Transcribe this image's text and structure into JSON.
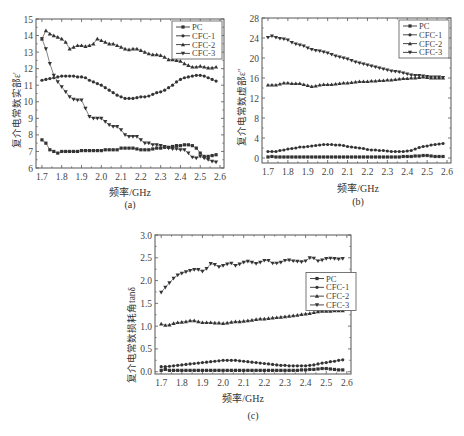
{
  "figure": {
    "captions": [
      "(a)",
      "(b)",
      "(c)"
    ],
    "xlabel": "频率/GHz"
  },
  "colors": {
    "axis": "#555555",
    "series": "#333333",
    "series_line": "#777777"
  },
  "chart_data": [
    {
      "id": "a",
      "type": "line",
      "caption": "(a)",
      "title": "",
      "xlabel": "频率/GHz",
      "ylabel": "复介电常数实部ε'",
      "xlim": [
        1.67,
        2.62
      ],
      "ylim": [
        6,
        15
      ],
      "xticks": [
        "1.7",
        "1.8",
        "1.9",
        "2.0",
        "2.1",
        "2.2",
        "2.3",
        "2.4",
        "2.5",
        "2.6"
      ],
      "yticks": [
        "6",
        "7",
        "8",
        "9",
        "10",
        "11",
        "12",
        "13",
        "14",
        "15"
      ],
      "legend": {
        "entries": [
          "PC",
          "CFC-1",
          "CFC-2",
          "CFC-3"
        ],
        "position": "upper right"
      },
      "grid": false,
      "x": [
        1.7,
        1.72,
        1.74,
        1.76,
        1.78,
        1.8,
        1.82,
        1.84,
        1.86,
        1.88,
        1.9,
        1.92,
        1.94,
        1.96,
        1.98,
        2.0,
        2.02,
        2.04,
        2.06,
        2.08,
        2.1,
        2.12,
        2.14,
        2.16,
        2.18,
        2.2,
        2.22,
        2.24,
        2.26,
        2.28,
        2.3,
        2.32,
        2.34,
        2.36,
        2.38,
        2.4,
        2.42,
        2.44,
        2.46,
        2.48,
        2.5,
        2.52,
        2.54,
        2.56,
        2.58
      ],
      "series": [
        {
          "name": "PC",
          "marker": "square",
          "values": [
            7.7,
            7.5,
            7.1,
            7.0,
            6.9,
            7.0,
            7.0,
            7.0,
            7.0,
            7.0,
            7.05,
            7.05,
            7.05,
            7.05,
            7.05,
            7.05,
            7.1,
            7.1,
            7.1,
            7.1,
            7.2,
            7.2,
            7.2,
            7.2,
            7.15,
            7.1,
            7.1,
            7.1,
            7.15,
            7.2,
            7.2,
            7.25,
            7.25,
            7.3,
            7.35,
            7.35,
            7.4,
            7.4,
            7.35,
            7.2,
            6.9,
            6.7,
            6.7,
            6.75,
            6.8
          ]
        },
        {
          "name": "CFC-1",
          "marker": "circle",
          "values": [
            11.3,
            11.35,
            11.4,
            11.45,
            11.5,
            11.55,
            11.55,
            11.55,
            11.55,
            11.5,
            11.5,
            11.45,
            11.3,
            11.2,
            11.1,
            11.0,
            10.85,
            10.7,
            10.55,
            10.4,
            10.3,
            10.2,
            10.2,
            10.2,
            10.25,
            10.3,
            10.3,
            10.35,
            10.45,
            10.55,
            10.6,
            10.7,
            10.85,
            11.0,
            11.2,
            11.35,
            11.45,
            11.5,
            11.55,
            11.6,
            11.6,
            11.55,
            11.45,
            11.35,
            11.25
          ]
        },
        {
          "name": "CFC-2",
          "marker": "triangle-up",
          "values": [
            13.8,
            14.3,
            14.1,
            14.0,
            13.9,
            13.8,
            13.6,
            13.2,
            13.3,
            13.4,
            13.4,
            13.35,
            13.4,
            13.5,
            13.8,
            13.7,
            13.6,
            13.5,
            13.5,
            13.4,
            13.3,
            13.2,
            13.15,
            13.2,
            13.2,
            13.1,
            13.0,
            12.9,
            12.85,
            12.85,
            12.8,
            12.7,
            12.55,
            12.55,
            12.5,
            12.45,
            12.3,
            12.2,
            12.1,
            12.1,
            12.15,
            12.1,
            12.05,
            12.05,
            12.1
          ]
        },
        {
          "name": "CFC-3",
          "marker": "triangle-down",
          "values": [
            13.8,
            13.2,
            12.3,
            11.6,
            11.2,
            10.9,
            10.6,
            10.3,
            10.15,
            10.1,
            10.1,
            9.6,
            9.1,
            9.0,
            9.0,
            9.0,
            8.8,
            8.6,
            8.5,
            8.5,
            8.3,
            8.0,
            7.9,
            7.9,
            7.9,
            7.7,
            7.5,
            7.5,
            7.4,
            7.4,
            7.35,
            7.3,
            7.2,
            7.15,
            7.15,
            7.1,
            7.1,
            6.9,
            6.65,
            6.6,
            6.7,
            6.6,
            6.5,
            6.4,
            6.35
          ]
        }
      ]
    },
    {
      "id": "b",
      "type": "line",
      "caption": "(b)",
      "title": "",
      "xlabel": "频率/GHz",
      "ylabel": "复介电常数虚部ε''",
      "xlim": [
        1.67,
        2.62
      ],
      "ylim": [
        -1,
        28
      ],
      "xticks": [
        "1.7",
        "1.8",
        "1.9",
        "2.0",
        "2.1",
        "2.2",
        "2.3",
        "2.4",
        "2.5",
        "2.6"
      ],
      "yticks": [
        "0",
        "4",
        "8",
        "12",
        "16",
        "20",
        "24",
        "28"
      ],
      "legend": {
        "entries": [
          "PC",
          "CFC-1",
          "CFC-2",
          "CFC-3"
        ],
        "position": "upper right"
      },
      "grid": false,
      "x": [
        1.7,
        1.72,
        1.74,
        1.76,
        1.78,
        1.8,
        1.82,
        1.84,
        1.86,
        1.88,
        1.9,
        1.92,
        1.94,
        1.96,
        1.98,
        2.0,
        2.02,
        2.04,
        2.06,
        2.08,
        2.1,
        2.12,
        2.14,
        2.16,
        2.18,
        2.2,
        2.22,
        2.24,
        2.26,
        2.28,
        2.3,
        2.32,
        2.34,
        2.36,
        2.38,
        2.4,
        2.42,
        2.44,
        2.46,
        2.48,
        2.5,
        2.52,
        2.54,
        2.56,
        2.58
      ],
      "series": [
        {
          "name": "PC",
          "marker": "square",
          "values": [
            0.2,
            0.3,
            0.2,
            0.2,
            0.2,
            0.2,
            0.2,
            0.2,
            0.2,
            0.2,
            0.2,
            0.2,
            0.2,
            0.2,
            0.2,
            0.2,
            0.2,
            0.2,
            0.2,
            0.2,
            0.2,
            0.2,
            0.2,
            0.2,
            0.2,
            0.2,
            0.2,
            0.2,
            0.2,
            0.2,
            0.2,
            0.2,
            0.2,
            0.2,
            0.3,
            0.3,
            0.3,
            0.4,
            0.4,
            0.5,
            0.5,
            0.4,
            0.3,
            0.3,
            0.3
          ]
        },
        {
          "name": "CFC-1",
          "marker": "circle",
          "values": [
            1.3,
            1.3,
            1.3,
            1.5,
            1.6,
            1.8,
            1.9,
            2.0,
            2.2,
            2.2,
            2.3,
            2.4,
            2.5,
            2.6,
            2.7,
            2.7,
            2.7,
            2.6,
            2.6,
            2.5,
            2.3,
            2.2,
            2.1,
            2.0,
            1.9,
            1.7,
            1.6,
            1.6,
            1.5,
            1.5,
            1.4,
            1.3,
            1.3,
            1.3,
            1.3,
            1.4,
            1.5,
            1.8,
            2.1,
            2.3,
            2.4,
            2.6,
            2.7,
            2.8,
            2.9
          ]
        },
        {
          "name": "CFC-2",
          "marker": "triangle-up",
          "values": [
            14.6,
            14.6,
            14.6,
            14.8,
            15.0,
            15.0,
            14.9,
            14.9,
            14.9,
            14.7,
            14.5,
            14.3,
            14.4,
            14.6,
            14.7,
            14.7,
            14.7,
            14.8,
            14.9,
            15.0,
            15.0,
            15.1,
            15.2,
            15.3,
            15.3,
            15.3,
            15.4,
            15.4,
            15.5,
            15.5,
            15.6,
            15.6,
            15.7,
            15.8,
            15.9,
            15.9,
            16.0,
            16.0,
            16.1,
            16.2,
            16.1,
            16.0,
            16.0,
            16.0,
            16.0
          ]
        },
        {
          "name": "CFC-3",
          "marker": "triangle-down",
          "values": [
            24.1,
            24.4,
            24.1,
            23.9,
            23.8,
            23.6,
            23.1,
            22.8,
            22.6,
            22.4,
            22.0,
            21.7,
            21.5,
            21.4,
            21.2,
            21.0,
            20.7,
            20.4,
            20.2,
            20.0,
            19.8,
            19.5,
            19.2,
            19.0,
            18.8,
            18.6,
            18.4,
            18.2,
            18.0,
            17.8,
            17.6,
            17.4,
            17.3,
            17.2,
            17.0,
            16.8,
            16.6,
            16.5,
            16.5,
            16.4,
            16.3,
            16.2,
            16.2,
            16.2,
            16.1
          ]
        }
      ]
    },
    {
      "id": "c",
      "type": "line",
      "caption": "(c)",
      "title": "",
      "xlabel": "频率/GHz",
      "ylabel": "复介电常数损耗角tanδ",
      "xlim": [
        1.67,
        2.62
      ],
      "ylim": [
        -0.05,
        3.0
      ],
      "xticks": [
        "1.7",
        "1.8",
        "1.9",
        "2.0",
        "2.1",
        "2.2",
        "2.3",
        "2.4",
        "2.5",
        "2.6"
      ],
      "yticks": [
        "0.0",
        "0.5",
        "1.0",
        "1.5",
        "2.0",
        "2.5",
        "3.0"
      ],
      "legend": {
        "entries": [
          "PC",
          "CFC-1",
          "CFC-2",
          "CFC-3"
        ],
        "position": "center right"
      },
      "grid": false,
      "x": [
        1.7,
        1.72,
        1.74,
        1.76,
        1.78,
        1.8,
        1.82,
        1.84,
        1.86,
        1.88,
        1.9,
        1.92,
        1.94,
        1.96,
        1.98,
        2.0,
        2.02,
        2.04,
        2.06,
        2.08,
        2.1,
        2.12,
        2.14,
        2.16,
        2.18,
        2.2,
        2.22,
        2.24,
        2.26,
        2.28,
        2.3,
        2.32,
        2.34,
        2.36,
        2.38,
        2.4,
        2.42,
        2.44,
        2.46,
        2.48,
        2.5,
        2.52,
        2.54,
        2.56,
        2.58
      ],
      "series": [
        {
          "name": "PC",
          "marker": "square",
          "values": [
            0.03,
            0.05,
            0.03,
            0.03,
            0.03,
            0.03,
            0.03,
            0.03,
            0.03,
            0.03,
            0.03,
            0.03,
            0.03,
            0.03,
            0.03,
            0.03,
            0.03,
            0.03,
            0.03,
            0.03,
            0.03,
            0.03,
            0.03,
            0.03,
            0.03,
            0.03,
            0.03,
            0.03,
            0.03,
            0.03,
            0.03,
            0.03,
            0.03,
            0.03,
            0.04,
            0.04,
            0.05,
            0.05,
            0.06,
            0.07,
            0.07,
            0.06,
            0.05,
            0.04,
            0.04
          ]
        },
        {
          "name": "CFC-1",
          "marker": "circle",
          "values": [
            0.11,
            0.11,
            0.12,
            0.13,
            0.14,
            0.15,
            0.16,
            0.17,
            0.18,
            0.19,
            0.2,
            0.21,
            0.22,
            0.23,
            0.24,
            0.25,
            0.25,
            0.25,
            0.25,
            0.24,
            0.23,
            0.22,
            0.21,
            0.2,
            0.19,
            0.18,
            0.17,
            0.16,
            0.15,
            0.14,
            0.14,
            0.13,
            0.13,
            0.13,
            0.13,
            0.13,
            0.14,
            0.15,
            0.17,
            0.19,
            0.2,
            0.22,
            0.23,
            0.25,
            0.26
          ]
        },
        {
          "name": "CFC-2",
          "marker": "triangle-up",
          "values": [
            1.05,
            1.02,
            1.03,
            1.06,
            1.08,
            1.09,
            1.1,
            1.12,
            1.12,
            1.1,
            1.08,
            1.08,
            1.08,
            1.07,
            1.07,
            1.06,
            1.07,
            1.09,
            1.1,
            1.1,
            1.11,
            1.12,
            1.13,
            1.15,
            1.16,
            1.16,
            1.17,
            1.18,
            1.19,
            1.2,
            1.21,
            1.22,
            1.23,
            1.24,
            1.26,
            1.27,
            1.28,
            1.3,
            1.32,
            1.33,
            1.33,
            1.33,
            1.34,
            1.34,
            1.34
          ]
        },
        {
          "name": "CFC-3",
          "marker": "triangle-down",
          "values": [
            1.74,
            1.85,
            1.95,
            2.05,
            2.12,
            2.16,
            2.19,
            2.22,
            2.24,
            2.24,
            2.2,
            2.26,
            2.37,
            2.35,
            2.3,
            2.33,
            2.36,
            2.38,
            2.33,
            2.36,
            2.4,
            2.42,
            2.4,
            2.37,
            2.4,
            2.44,
            2.44,
            2.38,
            2.38,
            2.4,
            2.44,
            2.45,
            2.43,
            2.42,
            2.41,
            2.43,
            2.5,
            2.49,
            2.43,
            2.45,
            2.48,
            2.49,
            2.48,
            2.47,
            2.48
          ]
        }
      ]
    }
  ]
}
